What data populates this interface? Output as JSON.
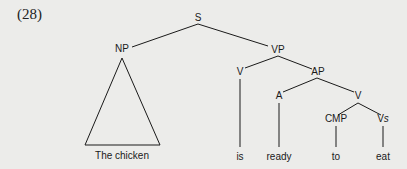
{
  "example_number": "(28)",
  "tree": {
    "root": "S",
    "nodes": {
      "S": "S",
      "NP": "NP",
      "VP": "VP",
      "V_is": "V",
      "AP": "AP",
      "A": "A",
      "V_inner": "V",
      "CMP": "CMP",
      "Vs_main": "V",
      "Vs_sub": "s"
    },
    "leaves": {
      "np_triangle": "The chicken",
      "is": "is",
      "ready": "ready",
      "to": "to",
      "eat": "eat"
    },
    "structure": "[S [NP The chicken] [VP [V is] [AP [A ready] [V [CMP to] [Vs eat]]]]]"
  }
}
